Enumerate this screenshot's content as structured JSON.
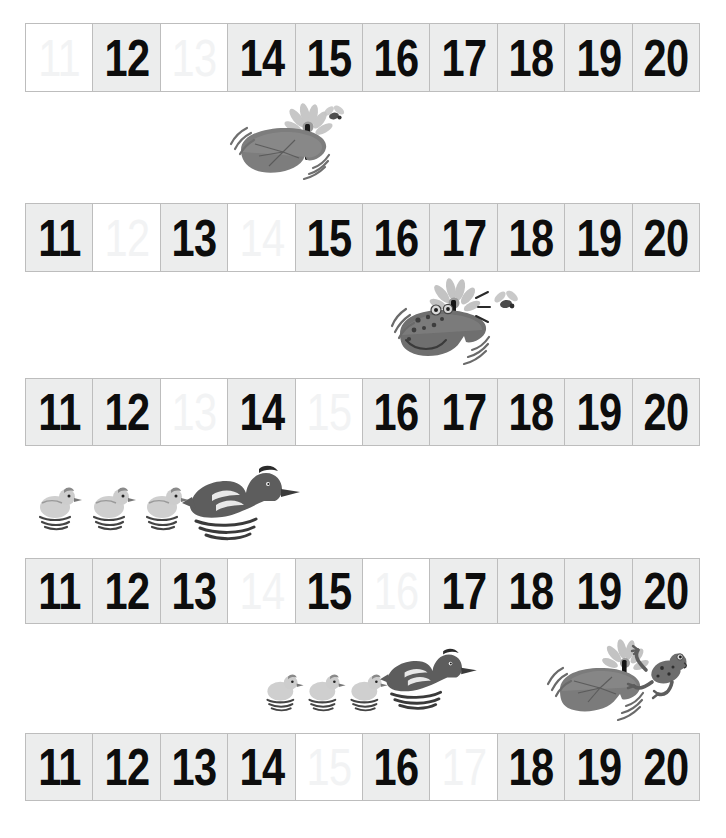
{
  "worksheet": {
    "title": "Number Line 11 to 20 Fill In The Missing Numbers",
    "range_start": 11,
    "range_end": 20,
    "cell_count_per_row": 10,
    "row_count": 5,
    "colors": {
      "page_background": "#ffffff",
      "cell_filled_background": "#eceded",
      "cell_blank_background": "#ffffff",
      "cell_border": "#bdbdbd",
      "numeral": "#0d0d0d",
      "ghost_numeral": "#f2f3f4",
      "art_dark": "#5f5f5f",
      "art_mid": "#8c8c8c",
      "art_light": "#c9c9c9"
    }
  },
  "rows": [
    {
      "id": "row1",
      "missing": [
        11,
        13
      ],
      "cells": [
        {
          "label": "11",
          "filled": false
        },
        {
          "label": "12",
          "filled": true
        },
        {
          "label": "13",
          "filled": false
        },
        {
          "label": "14",
          "filled": true
        },
        {
          "label": "15",
          "filled": true
        },
        {
          "label": "16",
          "filled": true
        },
        {
          "label": "17",
          "filled": true
        },
        {
          "label": "18",
          "filled": true
        },
        {
          "label": "19",
          "filled": true
        },
        {
          "label": "20",
          "filled": true
        }
      ]
    },
    {
      "id": "row2",
      "missing": [
        12,
        14
      ],
      "cells": [
        {
          "label": "11",
          "filled": true
        },
        {
          "label": "12",
          "filled": false
        },
        {
          "label": "13",
          "filled": true
        },
        {
          "label": "14",
          "filled": false
        },
        {
          "label": "15",
          "filled": true
        },
        {
          "label": "16",
          "filled": true
        },
        {
          "label": "17",
          "filled": true
        },
        {
          "label": "18",
          "filled": true
        },
        {
          "label": "19",
          "filled": true
        },
        {
          "label": "20",
          "filled": true
        }
      ]
    },
    {
      "id": "row3",
      "missing": [
        13,
        15
      ],
      "cells": [
        {
          "label": "11",
          "filled": true
        },
        {
          "label": "12",
          "filled": true
        },
        {
          "label": "13",
          "filled": false
        },
        {
          "label": "14",
          "filled": true
        },
        {
          "label": "15",
          "filled": false
        },
        {
          "label": "16",
          "filled": true
        },
        {
          "label": "17",
          "filled": true
        },
        {
          "label": "18",
          "filled": true
        },
        {
          "label": "19",
          "filled": true
        },
        {
          "label": "20",
          "filled": true
        }
      ]
    },
    {
      "id": "row4",
      "missing": [
        14,
        16
      ],
      "cells": [
        {
          "label": "11",
          "filled": true
        },
        {
          "label": "12",
          "filled": true
        },
        {
          "label": "13",
          "filled": true
        },
        {
          "label": "14",
          "filled": false
        },
        {
          "label": "15",
          "filled": true
        },
        {
          "label": "16",
          "filled": false
        },
        {
          "label": "17",
          "filled": true
        },
        {
          "label": "18",
          "filled": true
        },
        {
          "label": "19",
          "filled": true
        },
        {
          "label": "20",
          "filled": true
        }
      ]
    },
    {
      "id": "row5",
      "missing": [
        15,
        17
      ],
      "cells": [
        {
          "label": "11",
          "filled": true
        },
        {
          "label": "12",
          "filled": true
        },
        {
          "label": "13",
          "filled": true
        },
        {
          "label": "14",
          "filled": true
        },
        {
          "label": "15",
          "filled": false
        },
        {
          "label": "16",
          "filled": true
        },
        {
          "label": "17",
          "filled": false
        },
        {
          "label": "18",
          "filled": true
        },
        {
          "label": "19",
          "filled": true
        },
        {
          "label": "20",
          "filled": true
        }
      ]
    }
  ],
  "illustrations": [
    {
      "id": "art-lily1",
      "name": "lily-pad-with-flower-and-fly",
      "description": "Lily pad with white flower and a fly hovering",
      "after_row": "row1"
    },
    {
      "id": "art-frog1",
      "name": "frog-on-lily-pad-catching-fly",
      "description": "Frog sitting on lily pad reaching for a fly",
      "after_row": "row2"
    },
    {
      "id": "art-ducks1",
      "name": "duck-with-three-ducklings",
      "description": "Mother duck swimming with three ducklings",
      "after_row": "row3"
    },
    {
      "id": "art-ducks2",
      "name": "duck-with-three-ducklings",
      "description": "Mother duck swimming with three ducklings",
      "after_row": "row4"
    },
    {
      "id": "art-frog2",
      "name": "frog-jumping-onto-lily-pad",
      "description": "Frog leaping onto a lily pad with flower",
      "after_row": "row4"
    }
  ]
}
